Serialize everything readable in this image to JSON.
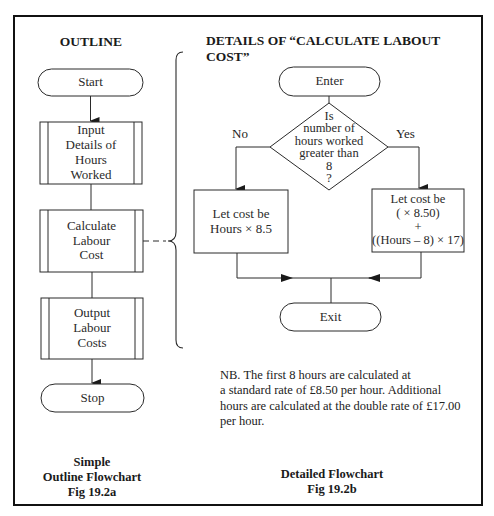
{
  "colors": {
    "line": "#2a2a2a",
    "frame": "#111111",
    "background": "#ffffff"
  },
  "outline": {
    "heading": "OUTLINE",
    "nodes": {
      "start": "Start",
      "input": [
        "Input",
        "Details of",
        "Hours",
        "Worked"
      ],
      "calculate": [
        "Calculate",
        "Labour",
        "Cost"
      ],
      "output": [
        "Output",
        "Labour",
        "Costs"
      ],
      "stop": "Stop"
    },
    "caption": [
      "Simple",
      "Outline Flowchart",
      "Fig 19.2a"
    ]
  },
  "detail": {
    "heading": "DETAILS OF “CALCULATE LABOUT COST”",
    "nodes": {
      "enter": "Enter",
      "decision": [
        "Is",
        "number of",
        "hours worked",
        "greater than",
        "8",
        "?"
      ],
      "no_label": "No",
      "yes_label": "Yes",
      "no_branch": [
        "Let cost be",
        "Hours × 8.5"
      ],
      "yes_branch": [
        "Let cost be",
        "(  × 8.50)",
        "+",
        "((Hours – 8) × 17)"
      ],
      "exit": "Exit"
    },
    "note": [
      "NB.   The first 8 hours are calculated at",
      "a standard rate of £8.50 per hour. Additional",
      "hours are calculated at the double rate of £17.00",
      "per hour."
    ],
    "caption": [
      "Detailed Flowchart",
      "Fig 19.2b"
    ]
  }
}
